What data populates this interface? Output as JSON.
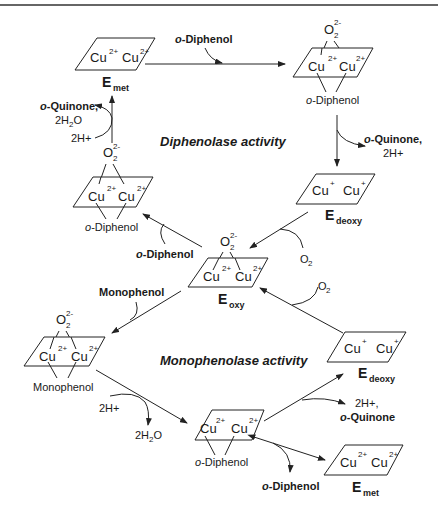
{
  "diagram": {
    "titles": {
      "diphenolase": "Diphenolase activity",
      "monophenolase": "Monophenolase activity"
    },
    "states": {
      "met_top": {
        "label": "E",
        "sub": "met",
        "cu1": "Cu",
        "cu1_charge": "2+",
        "cu2": "Cu",
        "cu2_charge": "2+"
      },
      "oxy_diphenol_top": {
        "o2": "O",
        "o2_sub": "2",
        "o2_charge": "2-",
        "cu1": "Cu",
        "cu1_charge": "2+",
        "cu2": "Cu",
        "cu2_charge": "2+",
        "ligand_prefix": "o",
        "ligand": "-Diphenol"
      },
      "deoxy_mid": {
        "label": "E",
        "sub": "deoxy",
        "cu1": "Cu",
        "cu1_charge": "+",
        "cu2": "Cu",
        "cu2_charge": "+"
      },
      "oxy_diphenol_left": {
        "o2": "O",
        "o2_sub": "2",
        "o2_charge": "2-",
        "cu1": "Cu",
        "cu1_charge": "2+",
        "cu2": "Cu",
        "cu2_charge": "2+",
        "ligand_prefix": "o",
        "ligand": "-Diphenol"
      },
      "oxy_center": {
        "label": "E",
        "sub": "oxy",
        "o2": "O",
        "o2_sub": "2",
        "o2_charge": "2-",
        "cu1": "Cu",
        "cu1_charge": "2+",
        "cu2": "Cu",
        "cu2_charge": "2+"
      },
      "oxy_monophenol": {
        "o2": "O",
        "o2_sub": "2",
        "o2_charge": "2-",
        "cu1": "Cu",
        "cu1_charge": "2+",
        "cu2": "Cu",
        "cu2_charge": "2+",
        "ligand": "Monophenol"
      },
      "deoxy_low": {
        "label": "E",
        "sub": "deoxy",
        "cu1": "Cu",
        "cu1_charge": "+",
        "cu2": "Cu",
        "cu2_charge": "+"
      },
      "met_diphenol_low": {
        "cu1": "Cu",
        "cu1_charge": "2+",
        "cu2": "Cu",
        "cu2_charge": "2+",
        "ligand_prefix": "o",
        "ligand": "-Diphenol"
      },
      "met_low": {
        "label": "E",
        "sub": "met",
        "cu1": "Cu",
        "cu1_charge": "2+",
        "cu2": "Cu",
        "cu2_charge": "2+"
      }
    },
    "reagents": {
      "o_diphenol_top": {
        "prefix": "o",
        "text": "-Diphenol"
      },
      "o_quinone_right": {
        "prefix": "o",
        "text": "-Quinone,",
        "line2": "2H+"
      },
      "o2_mid": {
        "text": "O",
        "sub": "2"
      },
      "o_diphenol_left": {
        "prefix": "o",
        "text": "-Diphenol"
      },
      "o_quinone_left": {
        "prefix": "o",
        "text": "-Quinone,",
        "line2a": "2H",
        "line2sub": "2",
        "line2b": "O"
      },
      "h_left": {
        "text": "2H+"
      },
      "monophenol": {
        "text": "Monophenol"
      },
      "o2_low": {
        "text": "O",
        "sub": "2"
      },
      "h_low": {
        "text": "2H+"
      },
      "h2o_low": {
        "a": "2H",
        "sub": "2",
        "b": "O"
      },
      "h_quinone_low": {
        "line1": "2H+,",
        "prefix": "o",
        "text": "-Quinone"
      },
      "o_diphenol_low": {
        "prefix": "o",
        "text": "-Diphenol"
      }
    }
  }
}
